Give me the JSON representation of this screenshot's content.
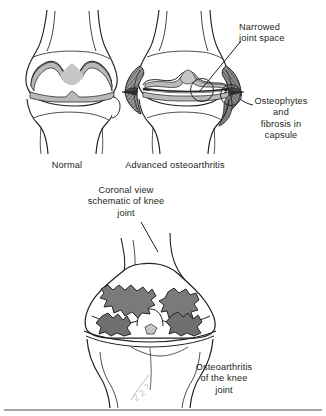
{
  "figure": {
    "background_color": "#ffffff",
    "ink_color": "#231f20",
    "cartilage_gray": "#b9b9b9",
    "osteophyte_gray": "#6f6f6f",
    "erosion_gray": "#7a7a7a",
    "shade_light": "#d8d8d8",
    "width": 326,
    "height": 416
  },
  "captions": {
    "normal": "Normal",
    "advanced": "Advanced osteoarthritis",
    "narrowed": "Narrowed\njoint space",
    "osteophytes": "Osteophytes\nand\nfibrosis in\ncapsule",
    "coronal": "Coronal view\nschematic of knee\njoint",
    "oa_knee": "Osteoarthritis\nof the knee\njoint"
  },
  "panels": [
    {
      "id": "normal-knee",
      "label": "Normal",
      "features": [
        "femoral condyles",
        "intact cartilage",
        "normal joint space",
        "tibial plateau",
        "fibula head"
      ]
    },
    {
      "id": "oa-knee",
      "label": "Advanced osteoarthritis",
      "features": [
        "narrowed joint space",
        "marginal osteophytes",
        "capsular fibrosis",
        "subchondral sclerosis"
      ]
    },
    {
      "id": "coronal-knee",
      "label": "Coronal view schematic of knee joint",
      "features": [
        "cartilage erosion patches",
        "intercondylar notch",
        "tibial plateau",
        "eroded subchondral bone"
      ]
    }
  ],
  "annotations": [
    {
      "id": "callout-narrowed",
      "text": "Narrowed joint space",
      "target": "joint space of osteoarthritic knee"
    },
    {
      "id": "callout-osteophytes",
      "text": "Osteophytes and fibrosis in capsule",
      "target": "lateral joint margin"
    },
    {
      "id": "callout-coronal",
      "text": "Coronal view schematic of knee joint",
      "target": "coronal knee drawing"
    },
    {
      "id": "callout-oa-knee",
      "text": "Osteoarthritis of the knee joint",
      "target": "coronal knee drawing"
    }
  ],
  "signature": {
    "present": true,
    "text": ""
  }
}
